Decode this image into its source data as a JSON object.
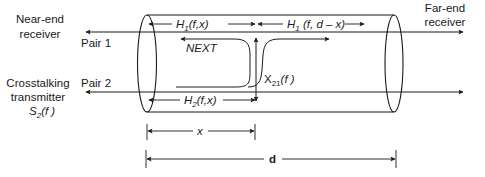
{
  "labels": {
    "near_end_line1": "Near-end",
    "near_end_line2": "receiver",
    "far_end_line1": "Far-end",
    "far_end_line2": "receiver",
    "pair1": "Pair 1",
    "pair2": "Pair 2",
    "crosstalk_line1": "Crosstalking",
    "crosstalk_line2": "transmitter",
    "source_S": "S",
    "source_sub": "2",
    "source_arg": "(f )",
    "next": "NEXT",
    "h1_near_H": "H",
    "h1_near_sub": "1",
    "h1_near_arg": "(f,x)",
    "h1_far_H": "H",
    "h1_far_sub": "1",
    "h1_far_arg": " (f, d – x)",
    "h2_H": "H",
    "h2_sub": "2",
    "h2_arg": "(f,x)",
    "x21_X": "X",
    "x21_sub": "21",
    "x21_arg": "(f )",
    "dim_x": "x",
    "dim_d": "d"
  },
  "colors": {
    "line": "#1a1a1a",
    "background": "#ffffff"
  }
}
